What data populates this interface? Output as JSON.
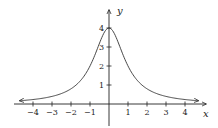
{
  "chart_data": {
    "type": "line",
    "title": "",
    "xlabel": "x",
    "ylabel": "y",
    "xlim": [
      -4.8,
      4.8
    ],
    "ylim": [
      0,
      4.4
    ],
    "grid": false,
    "legend": null,
    "x_ticks": [
      -4,
      -3,
      -2,
      -1,
      1,
      2,
      3,
      4
    ],
    "x_tick_labels": [
      "−4",
      "−3",
      "−2",
      "−1",
      "1",
      "2",
      "3",
      "4"
    ],
    "y_ticks": [
      1,
      2,
      3,
      4
    ],
    "y_tick_labels": [
      "1",
      "2",
      "3",
      "4"
    ],
    "function": "y = 4 / (1 + x^2)",
    "series": [
      {
        "name": "curve",
        "x": [
          -4.7,
          -4,
          -3,
          -2,
          -1.5,
          -1,
          -0.5,
          0,
          0.5,
          1,
          1.5,
          2,
          3,
          4,
          4.7
        ],
        "values": [
          0.17,
          0.24,
          0.4,
          0.8,
          1.23,
          2.0,
          3.2,
          4.0,
          3.2,
          2.0,
          1.23,
          0.8,
          0.4,
          0.24,
          0.17
        ]
      }
    ],
    "annotations": [
      "arrows on both curve ends",
      "arrows on axes"
    ]
  }
}
